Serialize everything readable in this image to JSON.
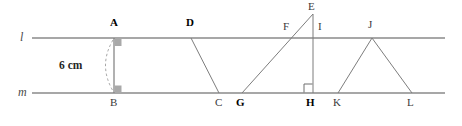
{
  "diagram": {
    "type": "geometry-parallel-lines",
    "canvas": {
      "width": 462,
      "height": 126,
      "background": "#ffffff"
    },
    "colors": {
      "line": "#8a8a8a",
      "segment": "#7d7d7d",
      "label": "#1a1a1a",
      "label_bold": "#000000",
      "label_thin": "#3a3a3a",
      "line_label": "#4a4a4a",
      "right_angle_fill": "#a9a9a9",
      "arc": "#9a9a9a"
    },
    "lines": [
      {
        "name": "l",
        "label": "l",
        "y": 38,
        "x1": 32,
        "x2": 445,
        "label_x": 22,
        "label_y": 31
      },
      {
        "name": "m",
        "label": "m",
        "y": 93,
        "x1": 32,
        "x2": 445,
        "label_x": 20,
        "label_y": 87
      }
    ],
    "points": [
      {
        "id": "A",
        "label": "A",
        "x": 114,
        "y": 38,
        "label_x": 110,
        "label_y": 18,
        "weight": "bold"
      },
      {
        "id": "B",
        "label": "B",
        "x": 114,
        "y": 93,
        "label_x": 110,
        "label_y": 98,
        "weight": "thin"
      },
      {
        "id": "D",
        "label": "D",
        "x": 191,
        "y": 38,
        "label_x": 187,
        "label_y": 18,
        "weight": "bold"
      },
      {
        "id": "C",
        "label": "C",
        "x": 219,
        "y": 93,
        "label_x": 215,
        "label_y": 98,
        "weight": "thin"
      },
      {
        "id": "E",
        "label": "E",
        "x": 313,
        "y": 13,
        "label_x": 308,
        "label_y": 1,
        "weight": "thin"
      },
      {
        "id": "F",
        "label": "F",
        "x": 288,
        "y": 38,
        "label_x": 283,
        "label_y": 21,
        "weight": "thin"
      },
      {
        "id": "G",
        "label": "G",
        "x": 242,
        "y": 93,
        "label_x": 237,
        "label_y": 98,
        "weight": "bold"
      },
      {
        "id": "I",
        "label": "I",
        "x": 313,
        "y": 38,
        "label_x": 318,
        "label_y": 21,
        "weight": "thin"
      },
      {
        "id": "H",
        "label": "H",
        "x": 313,
        "y": 93,
        "label_x": 307,
        "label_y": 98,
        "weight": "bold"
      },
      {
        "id": "J",
        "label": "J",
        "x": 372,
        "y": 38,
        "label_x": 368,
        "label_y": 19,
        "weight": "thin"
      },
      {
        "id": "K",
        "label": "K",
        "x": 338,
        "y": 93,
        "label_x": 333,
        "label_y": 98,
        "weight": "thin"
      },
      {
        "id": "L",
        "label": "L",
        "x": 412,
        "y": 93,
        "label_x": 407,
        "label_y": 98,
        "weight": "thin"
      }
    ],
    "segments": [
      {
        "id": "AB",
        "from": "A",
        "to": "B",
        "x1": 114,
        "y1": 38,
        "x2": 114,
        "y2": 93
      },
      {
        "id": "DC",
        "from": "D",
        "to": "C",
        "x1": 191,
        "y1": 38,
        "x2": 219,
        "y2": 93
      },
      {
        "id": "EG",
        "from": "E",
        "to": "G",
        "x1": 313,
        "y1": 14,
        "x2": 242,
        "y2": 93
      },
      {
        "id": "EH",
        "from": "E",
        "to": "H",
        "x1": 313,
        "y1": 14,
        "x2": 313,
        "y2": 93
      },
      {
        "id": "JK",
        "from": "J",
        "to": "K",
        "x1": 372,
        "y1": 38,
        "x2": 338,
        "y2": 93
      },
      {
        "id": "JL",
        "from": "J",
        "to": "L",
        "x1": 372,
        "y1": 38,
        "x2": 412,
        "y2": 93
      }
    ],
    "right_angle_marks": [
      {
        "id": "angle-at-A",
        "at": "A",
        "style": "filled",
        "x": 114,
        "y": 39,
        "size": 7
      },
      {
        "id": "angle-at-B",
        "at": "B",
        "style": "filled",
        "x": 114,
        "y": 86,
        "size": 7
      },
      {
        "id": "angle-at-H",
        "at": "H",
        "style": "open",
        "x": 313,
        "y": 84,
        "size": 9
      }
    ],
    "measurement": {
      "id": "distance-AB",
      "text": "6 cm",
      "label_x": 60,
      "label_y": 61,
      "arc": {
        "from_x": 114,
        "from_y": 40,
        "to_x": 114,
        "to_y": 91,
        "bulge_x": 99
      }
    }
  }
}
